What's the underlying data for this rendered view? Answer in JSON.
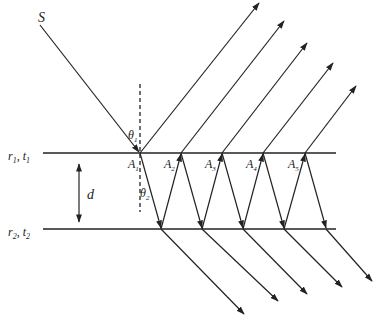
{
  "diagram": {
    "source_label": "S",
    "top_interface_label": {
      "main": "r",
      "sub1": "1",
      "sep": ", ",
      "main2": "t",
      "sub2": "1"
    },
    "bottom_interface_label": {
      "main": "r",
      "sub1": "2",
      "sep": ", ",
      "main2": "t",
      "sub2": "2"
    },
    "thickness_label": "d",
    "incidence_angle_label": {
      "main": "θ",
      "sub": "1"
    },
    "refraction_angle_label": {
      "main": "θ",
      "sub": "2"
    },
    "points": [
      {
        "main": "A",
        "sub": "1"
      },
      {
        "main": "A",
        "sub": "2"
      },
      {
        "main": "A",
        "sub": "3"
      },
      {
        "main": "A",
        "sub": "4"
      },
      {
        "main": "A",
        "sub": "5"
      }
    ],
    "reflected_beam_count": 5,
    "transmitted_beam_count": 5,
    "colors": {
      "line": "#222222",
      "background": "#ffffff"
    }
  }
}
